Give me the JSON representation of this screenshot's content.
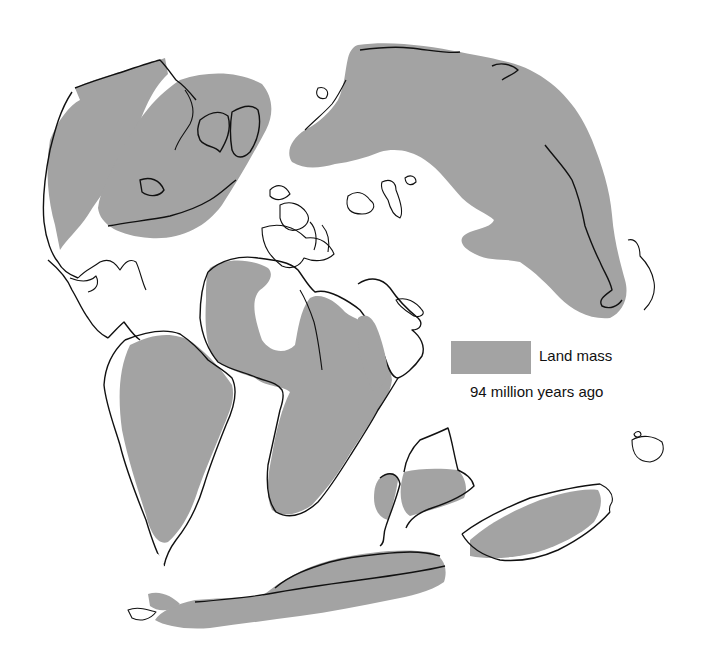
{
  "map": {
    "title": "Land mass 94 million years ago",
    "land_color": "#a3a3a3",
    "coastline_color": "#111111",
    "background_color": "#ffffff",
    "regions": [
      "north-america",
      "eurasia",
      "europe-islands",
      "south-america",
      "africa",
      "arabia",
      "madagascar-india",
      "antarctica",
      "australia",
      "new-zealand"
    ]
  },
  "legend": {
    "swatch_color": "#a3a3a3",
    "label": "Land mass",
    "caption": "94 million years ago"
  }
}
